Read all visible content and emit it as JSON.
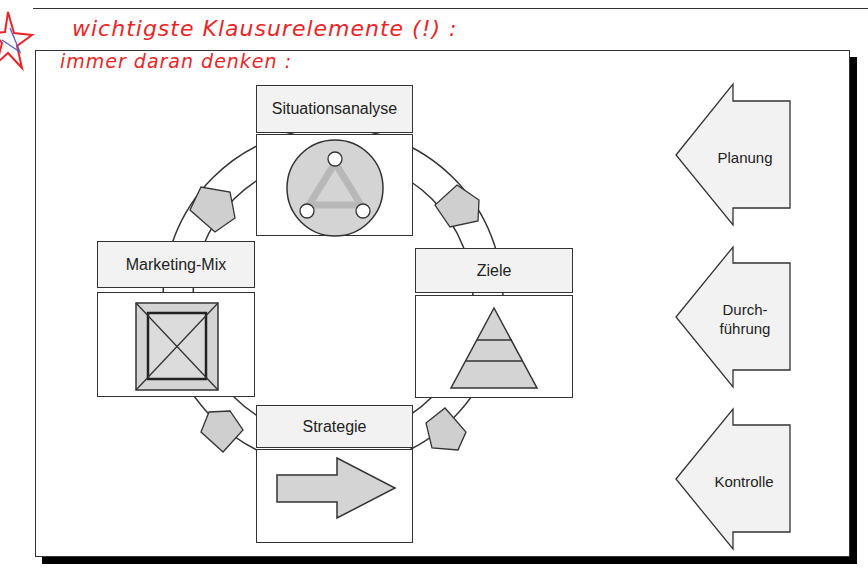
{
  "handwritten_notes": {
    "line1": "wichtigste Klausurelemente (!) :",
    "line2": "immer daran denken :",
    "star_icon": "star-doodle",
    "color": "#e8262a"
  },
  "cycle": {
    "steps": [
      {
        "label": "Situationsanalyse",
        "icon": "circle-triangle-icon"
      },
      {
        "label": "Ziele",
        "icon": "pyramid-icon"
      },
      {
        "label": "Strategie",
        "icon": "right-arrow-icon"
      },
      {
        "label": "Marketing-Mix",
        "icon": "framed-square-x-icon"
      }
    ],
    "direction": "clockwise"
  },
  "phases": [
    {
      "label": "Planung"
    },
    {
      "label": "Durch-\nführung",
      "line1": "Durch-",
      "line2": "führung"
    },
    {
      "label": "Kontrolle"
    }
  ],
  "colors": {
    "box_fill": "#f2f2f2",
    "shape_fill": "#d4d4d4",
    "stroke": "#333333",
    "shadow": "#000000"
  }
}
